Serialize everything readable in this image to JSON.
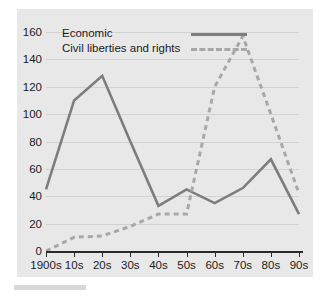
{
  "chart_data": {
    "type": "line",
    "title": "",
    "xlabel": "",
    "ylabel": "",
    "categories": [
      "1900s",
      "10s",
      "20s",
      "30s",
      "40s",
      "50s",
      "60s",
      "70s",
      "80s",
      "90s"
    ],
    "ylim": [
      0,
      160
    ],
    "ytick_step": 20,
    "yticks": [
      0,
      20,
      40,
      60,
      80,
      100,
      120,
      140,
      160
    ],
    "grid": true,
    "legend_position": "top-left",
    "series": [
      {
        "name": "Economic",
        "style": "solid",
        "color": "#7d7d7d",
        "values": [
          45,
          110,
          128,
          80,
          33,
          45,
          35,
          46,
          67,
          27
        ]
      },
      {
        "name": "Civil liberties and rights",
        "style": "dashed",
        "color": "#a8a8a8",
        "values": [
          0,
          10,
          11,
          18,
          27,
          27,
          120,
          157,
          100,
          42
        ]
      }
    ]
  },
  "colors": {
    "panel_background": "#e8e8e8",
    "page_background": "#ffffff",
    "gridline": "#d2d2d2",
    "axis": "#2a2a2a",
    "text": "#1b1b1b",
    "series_economic": "#7d7d7d",
    "series_civil": "#a8a8a8"
  }
}
